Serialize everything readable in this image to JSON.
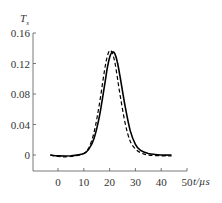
{
  "chart_data": {
    "type": "line",
    "title": "",
    "xlabel": "t/µs",
    "ylabel": "T_s",
    "xlim": [
      -5,
      50
    ],
    "ylim": [
      -0.02,
      0.16
    ],
    "xticks": [
      0,
      10,
      20,
      30,
      40,
      50
    ],
    "xtick_labels": [
      "0",
      "10",
      "20",
      "30",
      "40",
      "50"
    ],
    "yticks": [
      0,
      0.04,
      0.08,
      0.12,
      0.16
    ],
    "ytick_labels": [
      "0",
      "0.04",
      "0.08",
      "0.12",
      "0.16"
    ],
    "grid": false,
    "legend": null,
    "x": [
      -3,
      0,
      5,
      10,
      12,
      14,
      16,
      18,
      19,
      20,
      21,
      22,
      23,
      24,
      26,
      28,
      30,
      32,
      35,
      40,
      44
    ],
    "series": [
      {
        "name": "solid",
        "style": "solid",
        "color": "#000000",
        "values": [
          0.0,
          -0.001,
          -0.001,
          0.002,
          0.008,
          0.022,
          0.05,
          0.09,
          0.112,
          0.128,
          0.135,
          0.133,
          0.122,
          0.104,
          0.064,
          0.032,
          0.014,
          0.006,
          0.002,
          0.0,
          0.0
        ]
      },
      {
        "name": "dashed",
        "style": "dashed",
        "color": "#000000",
        "values": [
          0.0,
          -0.002,
          -0.002,
          0.002,
          0.01,
          0.03,
          0.066,
          0.11,
          0.128,
          0.137,
          0.134,
          0.122,
          0.102,
          0.08,
          0.042,
          0.018,
          0.008,
          0.003,
          0.0,
          -0.001,
          -0.001
        ]
      }
    ]
  },
  "axes": {
    "y_title_main": "T",
    "y_title_sub": "s",
    "x_title": "t/µs"
  }
}
